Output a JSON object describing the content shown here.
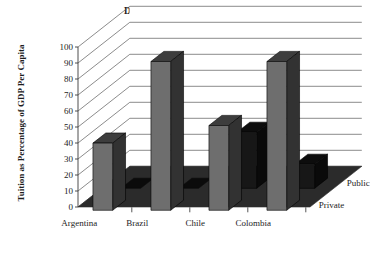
{
  "chart_data": {
    "type": "bar",
    "title": "Direct Costs for User (Tuition)",
    "xlabel": "",
    "ylabel": "Tuition as Percentage of GDP Per Capita",
    "ylim": [
      0,
      100
    ],
    "yticks": [
      0,
      10,
      20,
      30,
      40,
      50,
      60,
      70,
      80,
      90,
      100
    ],
    "ytick_labels": [
      "0",
      "10",
      "20",
      "30",
      "40",
      "50",
      "60",
      "70",
      "80",
      "90",
      "100"
    ],
    "categories": [
      "Argentina",
      "Brazil",
      "Chile",
      "Colombia"
    ],
    "series": [
      {
        "name": "Private",
        "values": [
          42,
          93,
          53,
          93
        ],
        "color": "#6e6e6e"
      },
      {
        "name": "Public",
        "values": [
          0,
          0,
          35,
          15
        ],
        "color": "#171717"
      }
    ],
    "legend_position": "right-depth-axis",
    "grid": true,
    "projection": "3d",
    "floor_color": "#2b2b2b",
    "gridline_color": "#5a5a5a",
    "background_color": "#ffffff"
  }
}
